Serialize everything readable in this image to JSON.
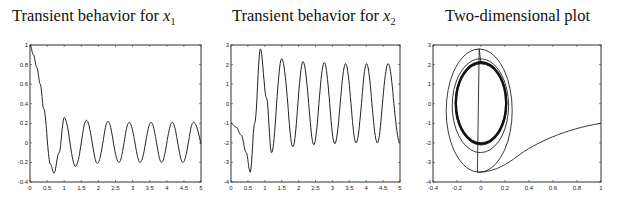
{
  "chart_data": [
    {
      "type": "line",
      "title": "Transient behavior for x1",
      "title_text": "Transient behavior for ",
      "title_var": "x",
      "title_sub": "1",
      "xlabel": "",
      "ylabel": "",
      "xlim": [
        0,
        5
      ],
      "ylim": [
        -0.4,
        1
      ],
      "xticks": [
        "0",
        "0.5",
        "1",
        "1.5",
        "2",
        "2.5",
        "3",
        "3.5",
        "4",
        "4.5",
        "5"
      ],
      "yticks": [
        "-0.4",
        "-0.2",
        "0",
        "0.2",
        "0.4",
        "0.6",
        "0.8",
        "1"
      ],
      "grid": false,
      "series": [
        {
          "name": "x1",
          "x": [
            0,
            0.1,
            0.2,
            0.3,
            0.4,
            0.5,
            0.6,
            0.7,
            0.85,
            1.0,
            1.17,
            1.33,
            1.5,
            1.65,
            1.82,
            1.97,
            2.13,
            2.28,
            2.44,
            2.6,
            2.75,
            2.9,
            3.07,
            3.22,
            3.38,
            3.54,
            3.7,
            3.85,
            4.0,
            4.16,
            4.32,
            4.47,
            4.63,
            4.78,
            5.0
          ],
          "y": [
            1,
            0.9,
            0.77,
            0.6,
            0.35,
            0.05,
            -0.22,
            -0.31,
            -0.1,
            0.26,
            0.0,
            -0.24,
            0.0,
            0.23,
            0.0,
            -0.21,
            0.0,
            0.22,
            0.0,
            -0.2,
            0.0,
            0.21,
            0.0,
            -0.2,
            0.0,
            0.21,
            0.0,
            -0.2,
            0.0,
            0.21,
            0.0,
            -0.2,
            0.0,
            0.21,
            -0.01
          ]
        }
      ]
    },
    {
      "type": "line",
      "title": "Transient behavior for x2",
      "title_text": "Transient behavior for ",
      "title_var": "x",
      "title_sub": "2",
      "xlabel": "",
      "ylabel": "",
      "xlim": [
        0,
        5
      ],
      "ylim": [
        -4,
        3
      ],
      "xticks": [
        "0",
        "0.5",
        "1",
        "1.5",
        "2",
        "2.5",
        "3",
        "3.5",
        "4",
        "4.5",
        "5"
      ],
      "yticks": [
        "-4",
        "-3",
        "-2",
        "-1",
        "0",
        "1",
        "2",
        "3"
      ],
      "grid": false,
      "series": [
        {
          "name": "x2",
          "x": [
            0,
            0.15,
            0.3,
            0.45,
            0.57,
            0.7,
            0.87,
            1.05,
            1.2,
            1.35,
            1.5,
            1.68,
            1.83,
            1.98,
            2.13,
            2.3,
            2.45,
            2.6,
            2.76,
            2.92,
            3.07,
            3.23,
            3.39,
            3.55,
            3.7,
            3.86,
            4.01,
            4.17,
            4.33,
            4.48,
            4.65,
            4.82,
            5.0
          ],
          "y": [
            -1,
            -1.2,
            -1.6,
            -2.5,
            -3.5,
            -1.0,
            2.8,
            0.3,
            -2.5,
            0.0,
            2.3,
            0.0,
            -2.2,
            0.0,
            2.15,
            0.0,
            -2.1,
            0.0,
            2.1,
            0.0,
            -2.05,
            0.0,
            2.05,
            0.0,
            -2.0,
            0.0,
            2.05,
            0.0,
            -2.0,
            0.0,
            2.05,
            0.0,
            -2.0
          ]
        }
      ]
    },
    {
      "type": "line",
      "title": "Two-dimensional plot",
      "xlabel": "",
      "ylabel": "",
      "xlim": [
        -0.4,
        1
      ],
      "ylim": [
        -4,
        3
      ],
      "xticks": [
        "-0.4",
        "-0.2",
        "0",
        "0.2",
        "0.4",
        "0.6",
        "0.8",
        "1"
      ],
      "yticks": [
        "-4",
        "-3",
        "-2",
        "-1",
        "0",
        "1",
        "2",
        "3"
      ],
      "grid": false,
      "series": [
        {
          "name": "phase (x1, x2)",
          "description": "trajectory starting at (1,-1), sweeping to (-0.03,-3.5), spiraling into a limit cycle of approx x1 in [-0.21,0.21], x2 in [-2.05,2.05]",
          "outer_loop": {
            "x_range": [
              -0.29,
              0.26
            ],
            "y_range": [
              -3.5,
              2.8
            ]
          },
          "second_loop": {
            "x_range": [
              -0.24,
              0.23
            ],
            "y_range": [
              -2.5,
              2.3
            ]
          },
          "limit_cycle": {
            "x_range": [
              -0.21,
              0.21
            ],
            "y_range": [
              -2.05,
              2.1
            ]
          }
        }
      ]
    }
  ]
}
